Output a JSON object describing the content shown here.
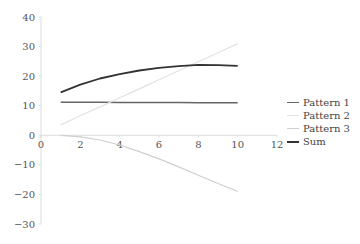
{
  "chart_data": {
    "type": "line",
    "title": "",
    "xlabel": "",
    "ylabel": "",
    "xlim": [
      0,
      12
    ],
    "ylim": [
      -30,
      40
    ],
    "x_ticks": [
      "0",
      "2",
      "4",
      "6",
      "8",
      "10",
      "12"
    ],
    "y_ticks": [
      "40",
      "30",
      "20",
      "10",
      "0",
      "−10",
      "−20",
      "−30"
    ],
    "grid": false,
    "legend_position": "right",
    "x": [
      1,
      2,
      3,
      4,
      5,
      6,
      7,
      8,
      9,
      10
    ],
    "series": [
      {
        "name": "Pattern 1",
        "color": "#666666",
        "width": 1.4,
        "values": [
          11.2,
          11.2,
          11.2,
          11.1,
          11.1,
          11.1,
          11.1,
          11.0,
          11.0,
          11.0
        ]
      },
      {
        "name": "Pattern 2",
        "color": "#e2e2e2",
        "width": 1.2,
        "values": [
          3.5,
          6.6,
          9.6,
          12.7,
          15.7,
          18.8,
          21.8,
          24.9,
          27.9,
          31.0
        ]
      },
      {
        "name": "Pattern 3",
        "color": "#cfcfcf",
        "width": 1.2,
        "values": [
          0.0,
          -0.5,
          -1.6,
          -3.3,
          -5.5,
          -8.0,
          -10.7,
          -13.5,
          -16.3,
          -19.0
        ]
      },
      {
        "name": "Sum",
        "color": "#333333",
        "width": 1.8,
        "values": [
          14.5,
          17.1,
          19.2,
          20.7,
          21.9,
          22.8,
          23.4,
          23.8,
          23.7,
          23.5
        ]
      }
    ]
  },
  "legend": {
    "items": [
      {
        "label": "Pattern 1",
        "color": "#666666"
      },
      {
        "label": "Pattern 2",
        "color": "#e2e2e2"
      },
      {
        "label": "Pattern 3",
        "color": "#cfcfcf"
      },
      {
        "label": "Sum",
        "color": "#333333"
      }
    ]
  }
}
